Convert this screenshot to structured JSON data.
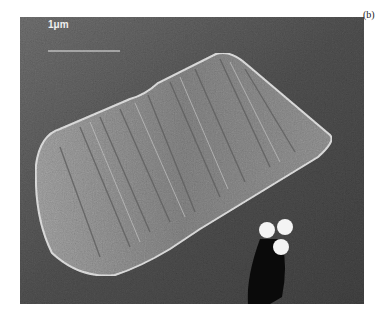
{
  "figure": {
    "panel_label": "(b)",
    "scale_bar": {
      "label": "1μm"
    },
    "colors": {
      "background_substrate": "#4a4a4a",
      "particle": "#8a8a8a",
      "spheres": "#f4f4f4",
      "shadow": "#0a0a0a"
    }
  }
}
